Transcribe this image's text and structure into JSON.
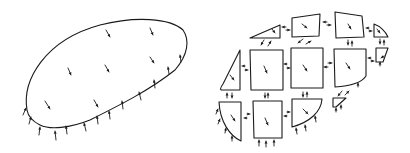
{
  "figure": {
    "ink_color": "#1a1a1a",
    "background": "#ffffff"
  },
  "left_body": {
    "outline": "M 27 110 C 22 80, 45 40, 100 25 C 135 16, 170 18, 183 30 C 190 40, 188 55, 175 70 C 150 90, 120 105, 90 120 C 70 128, 50 130, 40 125 C 32 121, 28 116, 27 110 Z",
    "body_force_arrows": [
      {
        "x": 106,
        "y": 30,
        "dx": 4,
        "dy": 7
      },
      {
        "x": 150,
        "y": 28,
        "dx": 3,
        "dy": 7
      },
      {
        "x": 68,
        "y": 68,
        "dx": 3,
        "dy": 7
      },
      {
        "x": 105,
        "y": 65,
        "dx": 4,
        "dy": 7
      },
      {
        "x": 150,
        "y": 57,
        "dx": 4,
        "dy": 6
      },
      {
        "x": 45,
        "y": 101,
        "dx": 5,
        "dy": 8
      },
      {
        "x": 94,
        "y": 100,
        "dx": 4,
        "dy": 7
      }
    ],
    "traction_arrows": [
      {
        "x": 23,
        "y": 115,
        "dx": 3,
        "dy": -7
      },
      {
        "x": 29,
        "y": 124,
        "dx": 2,
        "dy": -7
      },
      {
        "x": 39,
        "y": 135,
        "dx": 1,
        "dy": -8
      },
      {
        "x": 56,
        "y": 140,
        "dx": -1,
        "dy": -9
      },
      {
        "x": 67,
        "y": 134,
        "dx": -1,
        "dy": -8
      },
      {
        "x": 86,
        "y": 131,
        "dx": -2,
        "dy": -8
      },
      {
        "x": 98,
        "y": 124,
        "dx": -1,
        "dy": -8
      },
      {
        "x": 110,
        "y": 119,
        "dx": -1,
        "dy": -8
      },
      {
        "x": 123,
        "y": 109,
        "dx": -1,
        "dy": -8
      },
      {
        "x": 141,
        "y": 100,
        "dx": -2,
        "dy": -8
      },
      {
        "x": 155,
        "y": 88,
        "dx": -1,
        "dy": -8
      },
      {
        "x": 169,
        "y": 74,
        "dx": -1,
        "dy": -7
      },
      {
        "x": 181,
        "y": 62,
        "dx": -1,
        "dy": -7
      }
    ]
  },
  "right_pieces": {
    "cells": [
      {
        "name": "top-left-wedge",
        "path": "M 250 38 L 280 25 L 280 38 Z",
        "arrow": {
          "x": 272,
          "y": 29,
          "dx": 3,
          "dy": 4
        }
      },
      {
        "name": "top-mid-left",
        "path": "M 292 18 L 320 14 L 319 36 L 292 37 Z",
        "arrow": {
          "x": 302,
          "y": 24,
          "dx": 5,
          "dy": 4
        }
      },
      {
        "name": "top-mid-right",
        "path": "M 335 12 L 362 16 L 364 37 L 336 38 Z",
        "arrow": {
          "x": 348,
          "y": 24,
          "dx": 3,
          "dy": 5
        }
      },
      {
        "name": "top-right-cap",
        "path": "M 374 24 C 380 26, 386 32, 388 37 L 374 37 Z",
        "arrow": {
          "x": 377,
          "y": 29,
          "dx": 3,
          "dy": 4
        }
      },
      {
        "name": "mid-left-wedge",
        "path": "M 240 50 L 223 84 C 220 88, 220 90, 222 90 L 240 90 Z",
        "arrow": {
          "x": 230,
          "y": 75,
          "dx": 4,
          "dy": 5
        }
      },
      {
        "name": "mid-a",
        "path": "M 250 50 L 283 50 L 283 90 L 251 90 Z",
        "arrow": {
          "x": 264,
          "y": 66,
          "dx": 3,
          "dy": 7
        }
      },
      {
        "name": "mid-b",
        "path": "M 291 48 L 323 48 L 323 88 L 291 88 Z",
        "arrow": {
          "x": 303,
          "y": 65,
          "dx": 4,
          "dy": 6
        }
      },
      {
        "name": "mid-c",
        "path": "M 334 49 L 366 49 L 366 76 C 362 82, 352 86, 335 87 Z",
        "arrow": {
          "x": 346,
          "y": 63,
          "dx": 4,
          "dy": 6
        }
      },
      {
        "name": "mid-right-small",
        "path": "M 376 48 L 388 48 L 383 62 L 376 62 Z",
        "arrow": null
      },
      {
        "name": "bottom-small",
        "path": "M 333 98 L 346 98 L 336 107 L 333 107 Z",
        "arrow": null
      },
      {
        "name": "bottom-left-wedge",
        "path": "M 219 102 L 241 102 L 241 141 C 230 136, 220 122, 219 102 Z",
        "arrow": {
          "x": 231,
          "y": 115,
          "dx": 4,
          "dy": 6
        }
      },
      {
        "name": "bottom-a",
        "path": "M 253 101 L 282 101 L 282 138 L 254 138 Z",
        "arrow": {
          "x": 265,
          "y": 118,
          "dx": 3,
          "dy": 7
        }
      },
      {
        "name": "bottom-b",
        "path": "M 292 99 L 322 99 C 321 112, 310 122, 292 127 Z",
        "arrow": {
          "x": 303,
          "y": 109,
          "dx": 5,
          "dy": 5
        }
      }
    ],
    "interface_arrows": [
      {
        "x": 286,
        "y": 27,
        "dx": -4,
        "dy": 0
      },
      {
        "x": 286,
        "y": 30,
        "dx": 4,
        "dy": 0
      },
      {
        "x": 327,
        "y": 22,
        "dx": -4,
        "dy": 0
      },
      {
        "x": 327,
        "y": 25,
        "dx": 4,
        "dy": 0
      },
      {
        "x": 369,
        "y": 28,
        "dx": -3,
        "dy": 0
      },
      {
        "x": 369,
        "y": 31,
        "dx": 3,
        "dy": 0
      },
      {
        "x": 264,
        "y": 40,
        "dx": -3,
        "dy": 5
      },
      {
        "x": 268,
        "y": 46,
        "dx": 3,
        "dy": -5
      },
      {
        "x": 303,
        "y": 39,
        "dx": -5,
        "dy": 4
      },
      {
        "x": 306,
        "y": 44,
        "dx": 5,
        "dy": -3
      },
      {
        "x": 348,
        "y": 40,
        "dx": 0,
        "dy": 5
      },
      {
        "x": 352,
        "y": 46,
        "dx": 0,
        "dy": -5
      },
      {
        "x": 380,
        "y": 39,
        "dx": 0,
        "dy": 5
      },
      {
        "x": 384,
        "y": 45,
        "dx": 0,
        "dy": -5
      },
      {
        "x": 245,
        "y": 66,
        "dx": -3,
        "dy": 0
      },
      {
        "x": 245,
        "y": 70,
        "dx": 3,
        "dy": 0
      },
      {
        "x": 287,
        "y": 64,
        "dx": -3,
        "dy": 0
      },
      {
        "x": 287,
        "y": 68,
        "dx": 3,
        "dy": 0
      },
      {
        "x": 328,
        "y": 63,
        "dx": 4,
        "dy": 0
      },
      {
        "x": 328,
        "y": 67,
        "dx": -4,
        "dy": 0
      },
      {
        "x": 371,
        "y": 58,
        "dx": -3,
        "dy": 0
      },
      {
        "x": 371,
        "y": 61,
        "dx": 3,
        "dy": 0
      },
      {
        "x": 227,
        "y": 98,
        "dx": 0,
        "dy": -5
      },
      {
        "x": 232,
        "y": 93,
        "dx": 0,
        "dy": 5
      },
      {
        "x": 265,
        "y": 93,
        "dx": 0,
        "dy": 5
      },
      {
        "x": 268,
        "y": 98,
        "dx": 0,
        "dy": -5
      },
      {
        "x": 303,
        "y": 92,
        "dx": 0,
        "dy": 5
      },
      {
        "x": 307,
        "y": 97,
        "dx": 0,
        "dy": -5
      },
      {
        "x": 342,
        "y": 91,
        "dx": -4,
        "dy": 5
      },
      {
        "x": 345,
        "y": 95,
        "dx": 4,
        "dy": -4
      },
      {
        "x": 247,
        "y": 114,
        "dx": 3,
        "dy": 0
      },
      {
        "x": 247,
        "y": 118,
        "dx": -3,
        "dy": 0
      },
      {
        "x": 287,
        "y": 112,
        "dx": 3,
        "dy": 0
      },
      {
        "x": 287,
        "y": 116,
        "dx": -3,
        "dy": 0
      }
    ],
    "boundary_arrows": [
      {
        "x": 216,
        "y": 114,
        "dx": 2,
        "dy": -5
      },
      {
        "x": 218,
        "y": 124,
        "dx": 2,
        "dy": -5
      },
      {
        "x": 225,
        "y": 133,
        "dx": 1,
        "dy": -5
      },
      {
        "x": 232,
        "y": 141,
        "dx": 0,
        "dy": -5
      },
      {
        "x": 259,
        "y": 146,
        "dx": 0,
        "dy": -6
      },
      {
        "x": 266,
        "y": 147,
        "dx": 0,
        "dy": -6
      },
      {
        "x": 274,
        "y": 146,
        "dx": 0,
        "dy": -6
      },
      {
        "x": 297,
        "y": 134,
        "dx": -1,
        "dy": -6
      },
      {
        "x": 306,
        "y": 131,
        "dx": -1,
        "dy": -6
      },
      {
        "x": 316,
        "y": 122,
        "dx": -1,
        "dy": -6
      },
      {
        "x": 358,
        "y": 87,
        "dx": 0,
        "dy": -4
      },
      {
        "x": 336,
        "y": 112,
        "dx": 0,
        "dy": -4
      },
      {
        "x": 341,
        "y": 109,
        "dx": 0,
        "dy": -4
      },
      {
        "x": 384,
        "y": 56,
        "dx": -3,
        "dy": 2
      },
      {
        "x": 380,
        "y": 66,
        "dx": 0,
        "dy": -4
      }
    ]
  }
}
